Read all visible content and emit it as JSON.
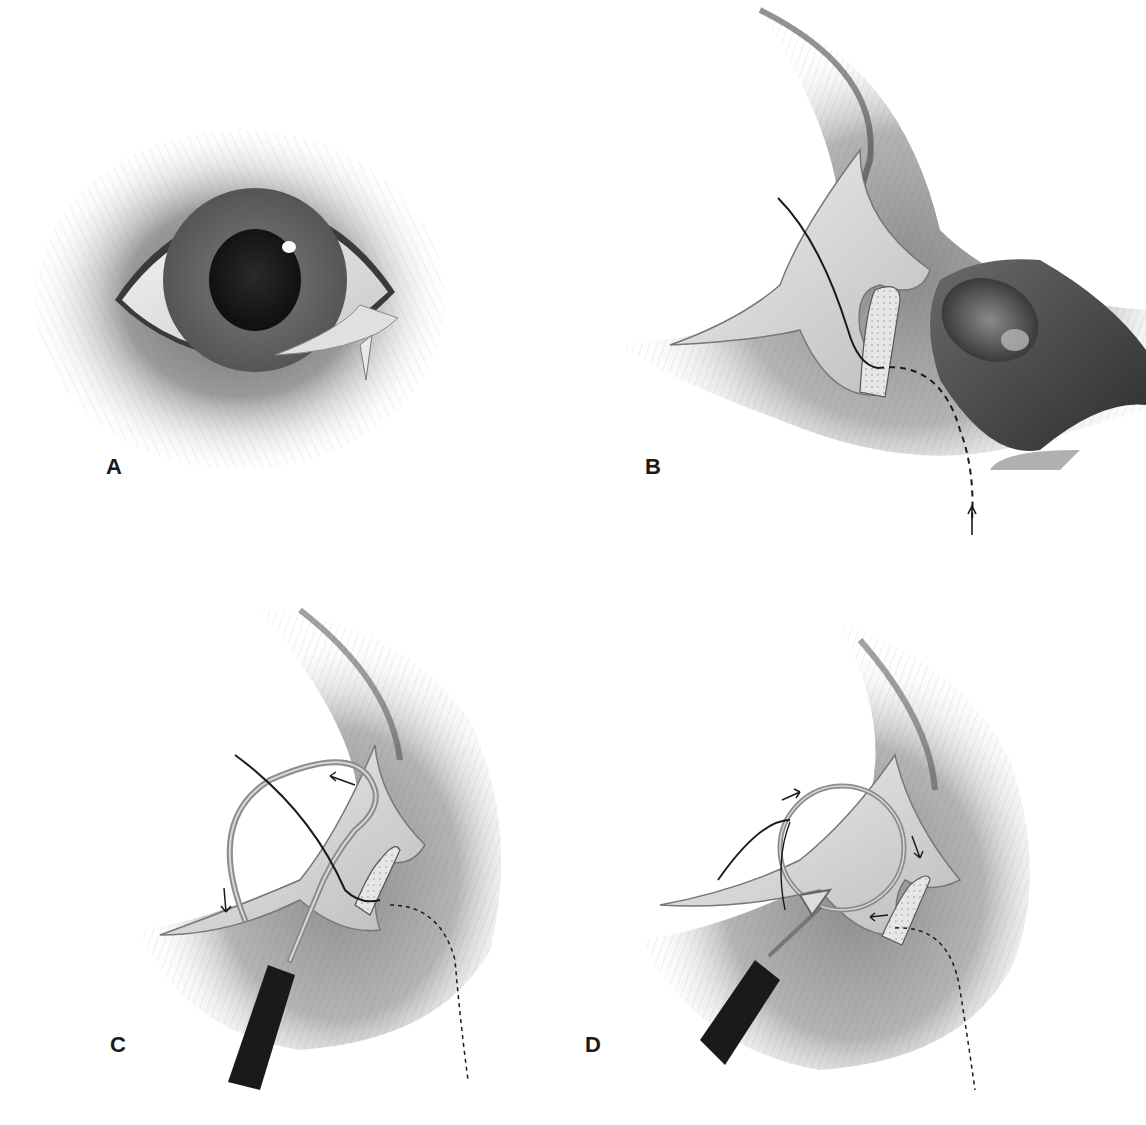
{
  "figure": {
    "panels": [
      {
        "id": "A",
        "label": "A",
        "subject": "eye-overview"
      },
      {
        "id": "B",
        "label": "B",
        "subject": "third-eyelid-everted-with-finger"
      },
      {
        "id": "C",
        "label": "C",
        "subject": "curved-needle-first-pass"
      },
      {
        "id": "D",
        "label": "D",
        "subject": "curved-needle-second-pass"
      }
    ]
  },
  "colors": {
    "background": "#ffffff",
    "skin_shadow": "#5a5a5a",
    "fur": "#8a8a8a",
    "iris": "#6e6e6e",
    "pupil": "#1e1e1e",
    "conjunctiva": "#e4e4e4",
    "handle": "#1a1a1a",
    "needle": "#9a9a9a"
  }
}
